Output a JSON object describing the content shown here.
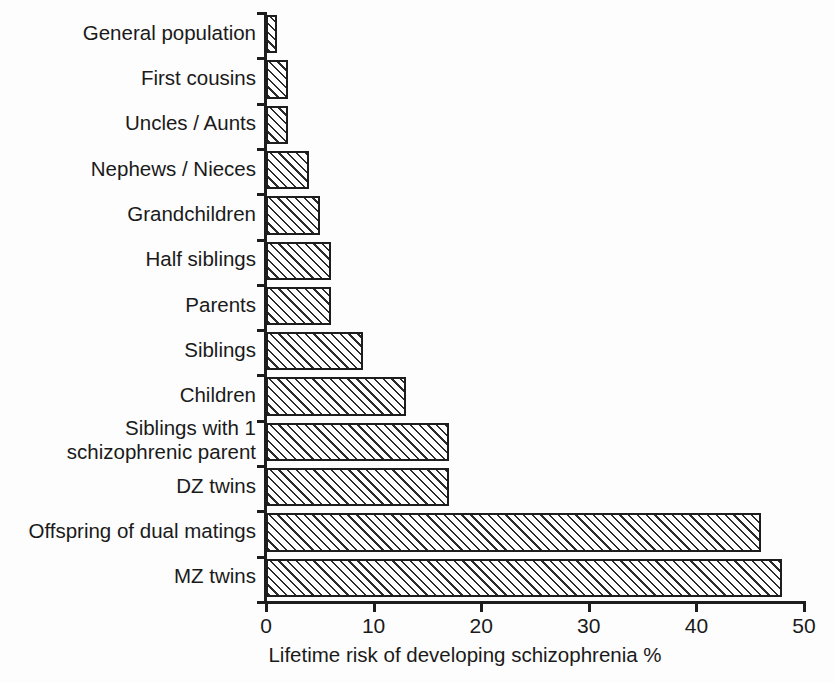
{
  "figure": {
    "background_color": "#fdfdfd",
    "axis_color": "#1d1d1d",
    "bar_fill_color": "#ffffff",
    "bar_hatch_color": "#2b2b2b",
    "bar_hatch_pattern": "diagonal-forward-slash"
  },
  "chart_data": {
    "type": "bar",
    "orientation": "horizontal",
    "title": "",
    "xlabel": "Lifetime risk of developing schizophrenia %",
    "ylabel": "",
    "xlim": [
      0,
      50
    ],
    "xticks": [
      0,
      10,
      20,
      30,
      40,
      50
    ],
    "xtick_labels": [
      "0",
      "10",
      "20",
      "30",
      "40",
      "50"
    ],
    "grid": false,
    "legend": false,
    "categories": [
      "General population",
      "First cousins",
      "Uncles / Aunts",
      "Nephews / Nieces",
      "Grandchildren",
      "Half siblings",
      "Parents",
      "Siblings",
      "Children",
      "Siblings with 1\nschizophrenic parent",
      "DZ twins",
      "Offspring of dual matings",
      "MZ twins"
    ],
    "values": [
      1,
      2,
      2,
      4,
      5,
      6,
      6,
      9,
      13,
      17,
      17,
      46,
      48
    ]
  }
}
